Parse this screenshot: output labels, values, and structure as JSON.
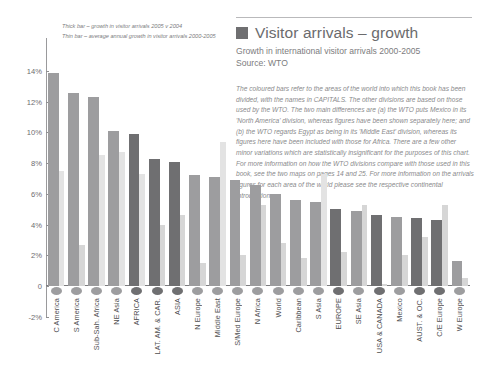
{
  "header": {
    "title": "Visitor arrivals – growth",
    "subtitle": "Growth in international visitor arrivals 2000-2005",
    "source": "Source: WTO",
    "swatch_color": "#6f6f71"
  },
  "legend": {
    "thick": "Thick bar – growth in visitor arrivals 2005 v 2004",
    "thin": "Thin bar – average annual growth in visitor arrivals 2000-2005"
  },
  "note": "The coloured bars refer to the areas of the world into which this book has been divided, with the names in CAPITALS. The other divisions are based on those used by the WTO. The two main differences are (a) the WTO puts Mexico in its 'North America' division, whereas figures have been shown separately here; and (b) the WTO regards Egypt as being in its 'Middle East' division, whereas its figures here have been included with those for Africa. There are a few other minor variations which are statistically insignificant for the purposes of this chart. For more information on how the WTO divisions compare with those used in this book, see the two maps on pages 14 and 25. For more information on the arrivals figures for each area of the world please see the respective continental introduction.",
  "chart_data": {
    "type": "bar",
    "title": "Visitor arrivals – growth",
    "subtitle": "Growth in international visitor arrivals 2000-2005",
    "xlabel": "",
    "ylabel": "",
    "ylim": [
      -2,
      14
    ],
    "ytick_labels": [
      "14%",
      "12%",
      "10%",
      "8%",
      "6%",
      "4%",
      "2%",
      "0",
      "-2%"
    ],
    "ytick_values": [
      14,
      12,
      10,
      8,
      6,
      4,
      2,
      0,
      -2
    ],
    "grid": false,
    "legend_position": "top-left",
    "categories": [
      "C America",
      "S America",
      "Sub-Sah. Africa",
      "NE Asia",
      "AFRICA",
      "LAT. AM. & CAR.",
      "ASIA",
      "N Europe",
      "Middle East",
      "S/Med Europe",
      "N Africa",
      "World",
      "Caribbean",
      "S Asia",
      "EUROPE",
      "SE Asia",
      "USA & CANADA",
      "Mexico",
      "AUST. & OC.",
      "C/E Europe",
      "W Europe"
    ],
    "series": [
      {
        "name": "Thick bar – growth in visitor arrivals 2005 v 2004",
        "values": [
          13.9,
          12.6,
          12.3,
          10.1,
          9.9,
          8.3,
          8.1,
          7.2,
          7.1,
          6.9,
          6.6,
          6.0,
          5.6,
          5.5,
          5.0,
          4.9,
          4.6,
          4.5,
          4.4,
          4.3,
          1.6
        ]
      },
      {
        "name": "Thin bar – average annual growth in visitor arrivals 2000-2005",
        "values": [
          7.5,
          2.7,
          8.5,
          8.7,
          7.3,
          4.0,
          4.6,
          1.5,
          9.4,
          2.0,
          5.3,
          2.8,
          1.8,
          7.3,
          2.2,
          5.3,
          0.1,
          2.0,
          3.2,
          5.3,
          0.5
        ]
      }
    ],
    "bar_colors": {
      "thick_default": "#9d9d9f",
      "thick_highlight": "#6f6f71",
      "thin_default": "#d6d6d6",
      "thin_light": "#e3e3e3"
    },
    "highlighted_categories": [
      "AFRICA",
      "LAT. AM. & CAR.",
      "ASIA",
      "EUROPE",
      "USA & CANADA",
      "AUST. & OC.",
      "C/E Europe"
    ]
  }
}
